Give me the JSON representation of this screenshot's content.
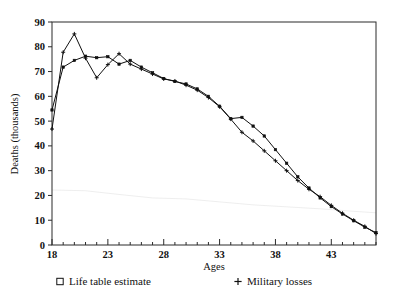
{
  "chart_data": {
    "type": "line",
    "title": "",
    "xlabel": "Ages",
    "ylabel": "Deaths (thousands)",
    "xlim": [
      18,
      47
    ],
    "ylim": [
      0,
      90
    ],
    "grid": false,
    "legend_position": "bottom",
    "x_tick_labels": [
      "18",
      "23",
      "28",
      "33",
      "38",
      "43"
    ],
    "x_tick_values": [
      18,
      23,
      28,
      33,
      38,
      43
    ],
    "x_minor_ticks": [
      19,
      20,
      21,
      22,
      24,
      25,
      26,
      27,
      29,
      30,
      31,
      32,
      34,
      35,
      36,
      37,
      39,
      40,
      41,
      42,
      44,
      45,
      46,
      47
    ],
    "y_tick_labels": [
      "0",
      "10",
      "20",
      "30",
      "40",
      "50",
      "60",
      "70",
      "80",
      "90"
    ],
    "y_tick_values": [
      0,
      10,
      20,
      30,
      40,
      50,
      60,
      70,
      80,
      90
    ],
    "x": [
      18,
      19,
      20,
      21,
      22,
      23,
      24,
      25,
      26,
      27,
      28,
      29,
      30,
      31,
      32,
      33,
      34,
      35,
      36,
      37,
      38,
      39,
      40,
      41,
      42,
      43,
      44,
      45,
      46,
      47
    ],
    "series": [
      {
        "name": "Life table estimate",
        "marker": "square",
        "values": [
          54.5,
          71.8,
          74.5,
          76.2,
          75.6,
          76.0,
          73.0,
          74.5,
          71.8,
          69.5,
          67.2,
          66.0,
          65.0,
          63.0,
          60.0,
          56.0,
          51.0,
          51.5,
          48.0,
          44.0,
          38.5,
          33.0,
          27.5,
          23.0,
          19.0,
          15.5,
          12.5,
          9.8,
          7.2,
          5.0
        ]
      },
      {
        "name": "Military losses",
        "marker": "plus",
        "values": [
          46.8,
          77.8,
          85.2,
          75.4,
          67.5,
          72.8,
          77.2,
          73.0,
          71.0,
          69.0,
          67.0,
          66.2,
          64.5,
          62.5,
          59.5,
          55.8,
          50.8,
          45.5,
          42.0,
          38.0,
          34.0,
          30.0,
          26.0,
          22.5,
          19.5,
          16.0,
          12.8,
          10.0,
          7.5,
          4.6
        ]
      }
    ]
  },
  "legend": {
    "items": [
      {
        "label": "Life table estimate",
        "marker": "square"
      },
      {
        "label": "Military losses",
        "marker": "plus"
      }
    ]
  }
}
